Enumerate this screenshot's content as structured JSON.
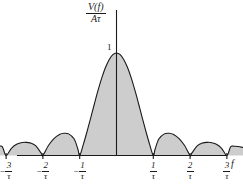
{
  "figure": {
    "name": "sinc-spectrum-plot",
    "background_color": "#ffffff",
    "line_color": "#1a1a1a",
    "fill_color": "#cdcdcd"
  },
  "y_axis": {
    "caption_numerator": "V(f)",
    "caption_denominator": "Aτ",
    "peak_label": "1"
  },
  "x_axis": {
    "name": "f",
    "ticks": [
      {
        "sign": "−",
        "numerator": "3",
        "denominator": "τ"
      },
      {
        "sign": "−",
        "numerator": "2",
        "denominator": "τ"
      },
      {
        "sign": "−",
        "numerator": "1",
        "denominator": "τ"
      },
      {
        "sign": "",
        "numerator": "1",
        "denominator": "τ"
      },
      {
        "sign": "",
        "numerator": "2",
        "denominator": "τ"
      },
      {
        "sign": "",
        "numerator": "3",
        "denominator": "τ"
      }
    ]
  },
  "chart_data": {
    "type": "line",
    "title": "",
    "xlabel": "f",
    "ylabel": "V(f)/Aτ",
    "function": "|sinc(pi*f*tau)|",
    "grid": false,
    "legend": null,
    "xlim": [
      -3.45,
      3.45
    ],
    "ylim": [
      0,
      1.12
    ],
    "x_tick_values": [
      -3,
      -2,
      -1,
      1,
      2,
      3
    ],
    "x_tick_labels": [
      "-3/τ",
      "-2/τ",
      "-1/τ",
      "1/τ",
      "2/τ",
      "3/τ"
    ],
    "y_tick_values": [
      1
    ],
    "y_tick_labels": [
      "1"
    ],
    "zero_crossings": [
      -3,
      -2,
      -1,
      1,
      2,
      3
    ],
    "lobe_peaks": [
      {
        "x": 0.0,
        "y": 1.0
      },
      {
        "x": 1.43,
        "y": 0.217
      },
      {
        "x": -1.43,
        "y": 0.217
      },
      {
        "x": 2.46,
        "y": 0.128
      },
      {
        "x": -2.46,
        "y": 0.128
      },
      {
        "x": 3.2,
        "y": 0.09
      },
      {
        "x": -3.2,
        "y": 0.09
      }
    ],
    "values": [
      {
        "x": -3.45,
        "y": 0.077
      },
      {
        "x": -3.3,
        "y": 0.088
      },
      {
        "x": -3.2,
        "y": 0.09
      },
      {
        "x": -3.1,
        "y": 0.085
      },
      {
        "x": -3.0,
        "y": 0.0
      },
      {
        "x": -2.85,
        "y": 0.073
      },
      {
        "x": -2.7,
        "y": 0.112
      },
      {
        "x": -2.55,
        "y": 0.127
      },
      {
        "x": -2.46,
        "y": 0.128
      },
      {
        "x": -2.35,
        "y": 0.123
      },
      {
        "x": -2.2,
        "y": 0.096
      },
      {
        "x": -2.05,
        "y": 0.025
      },
      {
        "x": -2.0,
        "y": 0.0
      },
      {
        "x": -1.85,
        "y": 0.097
      },
      {
        "x": -1.7,
        "y": 0.165
      },
      {
        "x": -1.55,
        "y": 0.205
      },
      {
        "x": -1.43,
        "y": 0.217
      },
      {
        "x": -1.3,
        "y": 0.211
      },
      {
        "x": -1.15,
        "y": 0.161
      },
      {
        "x": -1.05,
        "y": 0.063
      },
      {
        "x": -1.0,
        "y": 0.0
      },
      {
        "x": -0.9,
        "y": 0.109
      },
      {
        "x": -0.8,
        "y": 0.234
      },
      {
        "x": -0.7,
        "y": 0.368
      },
      {
        "x": -0.6,
        "y": 0.505
      },
      {
        "x": -0.5,
        "y": 0.637
      },
      {
        "x": -0.4,
        "y": 0.757
      },
      {
        "x": -0.3,
        "y": 0.858
      },
      {
        "x": -0.2,
        "y": 0.935
      },
      {
        "x": -0.1,
        "y": 0.984
      },
      {
        "x": 0.0,
        "y": 1.0
      },
      {
        "x": 0.1,
        "y": 0.984
      },
      {
        "x": 0.2,
        "y": 0.935
      },
      {
        "x": 0.3,
        "y": 0.858
      },
      {
        "x": 0.4,
        "y": 0.757
      },
      {
        "x": 0.5,
        "y": 0.637
      },
      {
        "x": 0.6,
        "y": 0.505
      },
      {
        "x": 0.7,
        "y": 0.368
      },
      {
        "x": 0.8,
        "y": 0.234
      },
      {
        "x": 0.9,
        "y": 0.109
      },
      {
        "x": 1.0,
        "y": 0.0
      },
      {
        "x": 1.05,
        "y": 0.063
      },
      {
        "x": 1.15,
        "y": 0.161
      },
      {
        "x": 1.3,
        "y": 0.211
      },
      {
        "x": 1.43,
        "y": 0.217
      },
      {
        "x": 1.55,
        "y": 0.205
      },
      {
        "x": 1.7,
        "y": 0.165
      },
      {
        "x": 1.85,
        "y": 0.097
      },
      {
        "x": 2.0,
        "y": 0.0
      },
      {
        "x": 2.05,
        "y": 0.025
      },
      {
        "x": 2.2,
        "y": 0.096
      },
      {
        "x": 2.35,
        "y": 0.123
      },
      {
        "x": 2.46,
        "y": 0.128
      },
      {
        "x": 2.55,
        "y": 0.127
      },
      {
        "x": 2.7,
        "y": 0.112
      },
      {
        "x": 2.85,
        "y": 0.073
      },
      {
        "x": 3.0,
        "y": 0.0
      },
      {
        "x": 3.1,
        "y": 0.085
      },
      {
        "x": 3.2,
        "y": 0.09
      },
      {
        "x": 3.3,
        "y": 0.088
      },
      {
        "x": 3.45,
        "y": 0.077
      }
    ]
  }
}
